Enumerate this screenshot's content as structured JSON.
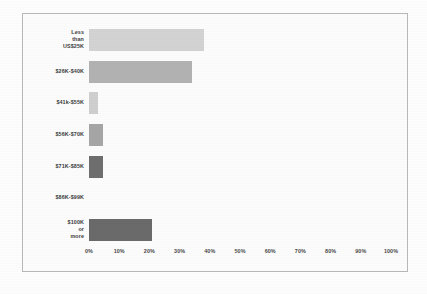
{
  "chart_data": {
    "type": "bar",
    "orientation": "horizontal",
    "title": "",
    "subtitle": "",
    "xlabel": "",
    "ylabel": "",
    "xlim": [
      0,
      100
    ],
    "x_tick_labels": [
      "0%",
      "10%",
      "20%",
      "30%",
      "40%",
      "50%",
      "60%",
      "70%",
      "80%",
      "90%",
      "100%"
    ],
    "x_tick_values": [
      0,
      10,
      20,
      30,
      40,
      50,
      60,
      70,
      80,
      90,
      100
    ],
    "grid": false,
    "legend": "none",
    "value_suffix": "%",
    "categories": [
      "Less than\nUS$25K",
      "$26K-$40K",
      "$41k-$55K",
      "$56K-$70K",
      "$71K-$85K",
      "$86K-$99K",
      "$100K or more"
    ],
    "values": [
      38,
      34,
      3,
      4.5,
      4.5,
      0,
      21
    ],
    "bar_colors": [
      "#d3d3d3",
      "#b2b2b2",
      "#cfcfcf",
      "#a6a6a6",
      "#6e6e6e",
      "#cfcfcf",
      "#6a6a6a"
    ],
    "series": [
      {
        "name": "Respondents",
        "values": [
          38,
          34,
          3,
          4.5,
          4.5,
          0,
          21
        ]
      }
    ]
  },
  "figure": {
    "background_color": "#fcfcfc",
    "border_color": "#b8b8b8"
  }
}
